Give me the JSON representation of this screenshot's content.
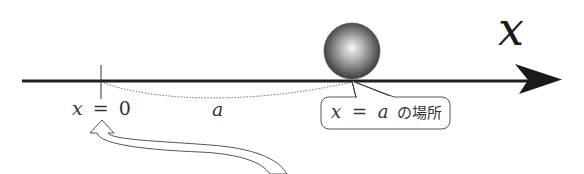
{
  "diagram": {
    "axis": {
      "label": "x",
      "color": "#222222"
    },
    "origin": {
      "var": "x",
      "equals": "=",
      "value": "0"
    },
    "distance": {
      "label": "a"
    },
    "ball": {
      "description": "sphere",
      "shade_light": "#f5f5f5",
      "shade_dark": "#3a3a3a"
    },
    "callout": {
      "var": "x",
      "equals": "=",
      "value": "a",
      "suffix": "の場所"
    },
    "pointer_arrow": {
      "description": "hollow curved arrow pointing to origin"
    }
  }
}
